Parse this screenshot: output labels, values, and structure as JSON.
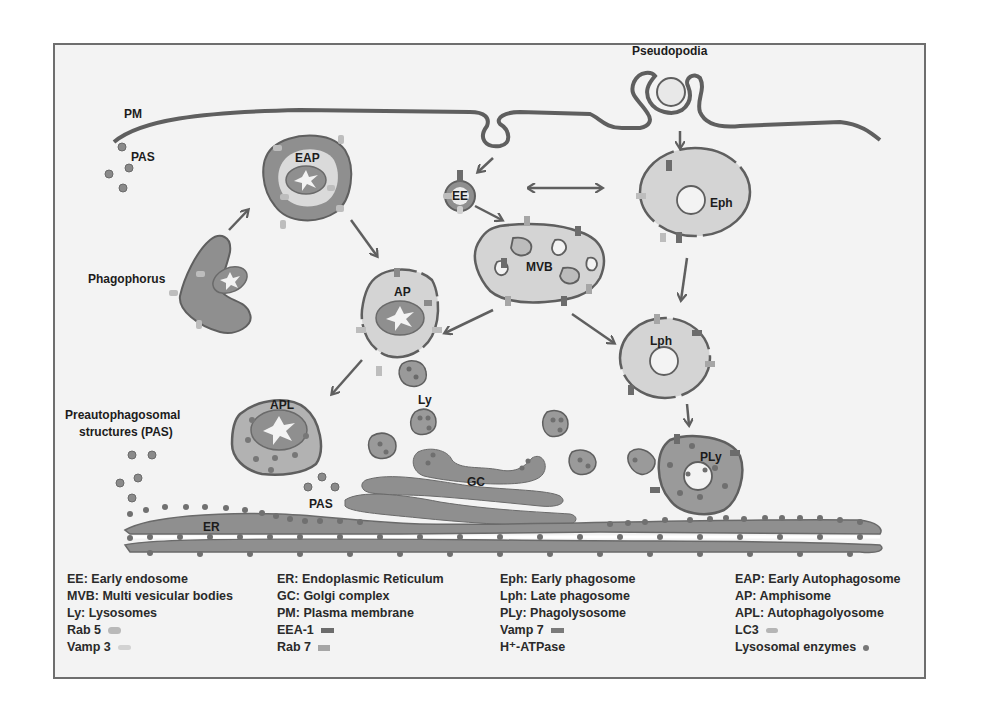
{
  "labels": {
    "pm": "PM",
    "pas_top": "PAS",
    "eap": "EAP",
    "phagophorus": "Phagophorus",
    "ee": "EE",
    "mvb": "MVB",
    "eph": "Eph",
    "pseudopodia": "Pseudopodia",
    "ap": "AP",
    "lph": "Lph",
    "apl": "APL",
    "ly": "Ly",
    "preauto_line1": "Preautophagosomal",
    "preauto_line2": "structures (PAS)",
    "pas_bottom": "PAS",
    "gc": "GC",
    "er": "ER",
    "ply": "PLy"
  },
  "legend": {
    "col1": [
      {
        "text": "EE: Early endosome"
      },
      {
        "text": "MVB: Multi vesicular bodies"
      },
      {
        "text": "Ly: Lysosomes"
      },
      {
        "text": "Rab 5",
        "swatch": "rab5"
      },
      {
        "text": "Vamp 3",
        "swatch": "vamp3"
      }
    ],
    "col2": [
      {
        "text": "ER: Endoplasmic Reticulum"
      },
      {
        "text": "GC: Golgi complex"
      },
      {
        "text": "PM: Plasma membrane"
      },
      {
        "text": "EEA-1",
        "swatch": "eea1"
      },
      {
        "text": "Rab 7",
        "swatch": "rab7"
      }
    ],
    "col3": [
      {
        "text": "Eph: Early phagosome"
      },
      {
        "text": "Lph: Late phagosome"
      },
      {
        "text": "PLy: Phagolysosome"
      },
      {
        "text": "Vamp 7",
        "swatch": "vamp7"
      },
      {
        "text": "H⁺-ATPase",
        "swatch": "h_atpase"
      }
    ],
    "col4": [
      {
        "text": "EAP: Early Autophagosome"
      },
      {
        "text": "AP: Amphisome"
      },
      {
        "text": "APL: Autophagolyosome"
      },
      {
        "text": "LC3",
        "swatch": "lc3"
      },
      {
        "text": "Lysosomal enzymes",
        "swatch": "lysosomal_enzymes"
      }
    ]
  },
  "colors": {
    "membrane": "#5f5f5f",
    "organelle_fill_light": "#d4d4d4",
    "organelle_fill_dark": "#8f8f8f",
    "rab5": "#b9b9b9",
    "vamp3": "#cfcfcf",
    "eea1": "#6c6c6c",
    "rab7": "#a6a6a6",
    "vamp7": "#7a7a7a",
    "lc3": "#b5b5b5",
    "lysosomal_enzymes": "#777777",
    "frame_bg": "#f3f3f3"
  }
}
